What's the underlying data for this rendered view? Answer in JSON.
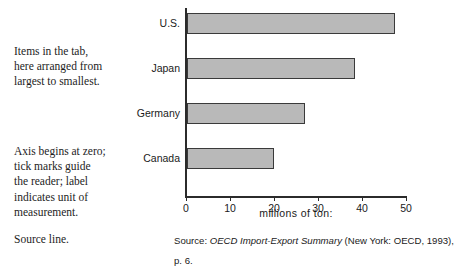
{
  "annotations": {
    "items": [
      "Items in the tab,",
      "here arranged from",
      "largest to smallest."
    ],
    "axis": [
      "Axis begins at zero;",
      "tick marks guide",
      "the reader; label",
      "indicates unit of",
      "measurement."
    ],
    "source_label": "Source line."
  },
  "source": {
    "prefix": "Source: ",
    "title": "OECD Import-Export Summary",
    "rest": " (New York: OECD, 1993),",
    "page": "p. 6."
  },
  "chart_data": {
    "type": "bar",
    "orientation": "horizontal",
    "title": "",
    "categories": [
      "U.S.",
      "Japan",
      "Germany",
      "Canada"
    ],
    "values": [
      47,
      38,
      26.5,
      19.5
    ],
    "xlabel": "millions of ton:",
    "ylabel": "",
    "xlim": [
      0,
      50
    ],
    "xticks": [
      0,
      10,
      20,
      30,
      40,
      50
    ],
    "xticklabels": [
      "0",
      "10",
      "20",
      "30",
      "40",
      "50"
    ],
    "grid": false,
    "legend": false,
    "bar_fill": "#b9b9b9",
    "bar_border": "#3a3a3a"
  }
}
